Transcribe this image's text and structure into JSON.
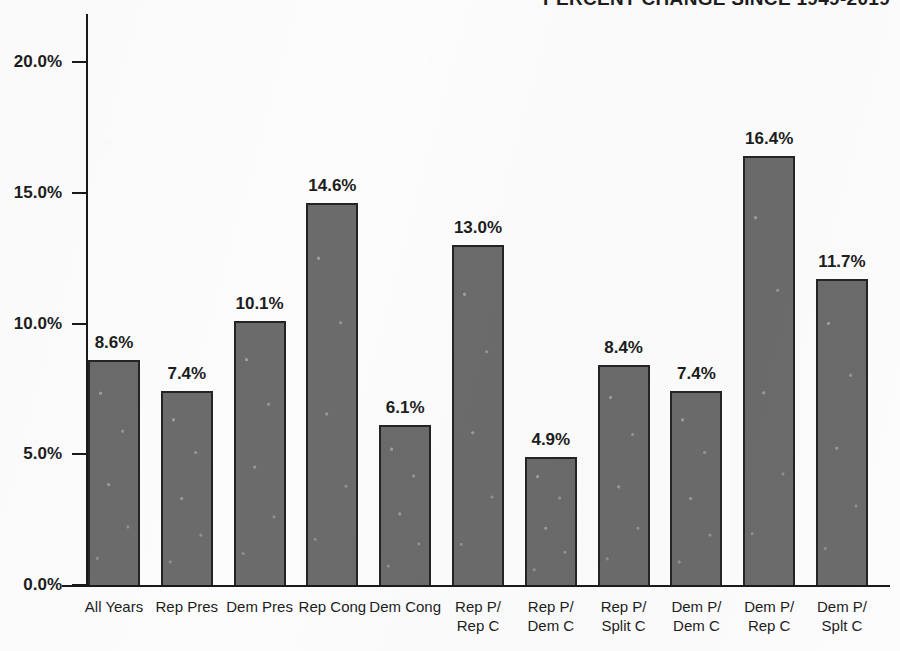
{
  "chart_data": {
    "type": "bar",
    "title": "PERCENT CHANGE SINCE 1949-2019",
    "title_note": "title is clipped by the top edge of the page; only the lower halves of the letters are visible",
    "xlabel": "",
    "ylabel": "",
    "ylim": [
      0,
      20
    ],
    "grid": false,
    "legend": null,
    "y_ticks": [
      "0.0%",
      "5.0%",
      "10.0%",
      "15.0%",
      "20.0%"
    ],
    "y_tick_values": [
      0,
      5,
      10,
      15,
      20
    ],
    "categories": [
      "All Years",
      "Rep Pres",
      "Dem Pres",
      "Rep Cong",
      "Dem Cong",
      "Rep P/ Rep C",
      "Rep P/ Dem C",
      "Rep P/ Split C",
      "Dem P/ Dem C",
      "Dem P/ Rep C",
      "Dem P/ Splt C"
    ],
    "category_lines": [
      [
        "All Years"
      ],
      [
        "Rep Pres"
      ],
      [
        "Dem Pres"
      ],
      [
        "Rep Cong"
      ],
      [
        "Dem Cong"
      ],
      [
        "Rep P/",
        "Rep C"
      ],
      [
        "Rep P/",
        "Dem C"
      ],
      [
        "Rep P/",
        "Split C"
      ],
      [
        "Dem P/",
        "Dem C"
      ],
      [
        "Dem P/",
        "Rep C"
      ],
      [
        "Dem P/",
        "Splt C"
      ]
    ],
    "values": [
      8.6,
      7.4,
      10.1,
      14.6,
      6.1,
      13.0,
      4.9,
      8.4,
      7.4,
      16.4,
      11.7
    ],
    "value_labels": [
      "8.6%",
      "7.4%",
      "10.1%",
      "14.6%",
      "6.1%",
      "13.0%",
      "4.9%",
      "8.4%",
      "7.4%",
      "16.4%",
      "11.7%"
    ]
  },
  "style": {
    "background": "#fcfcfc",
    "bar_fill": "#6b6b6b",
    "bar_stroke": "#242424",
    "axis_color": "#1a1a1a",
    "text_color": "#1d1d1d"
  }
}
